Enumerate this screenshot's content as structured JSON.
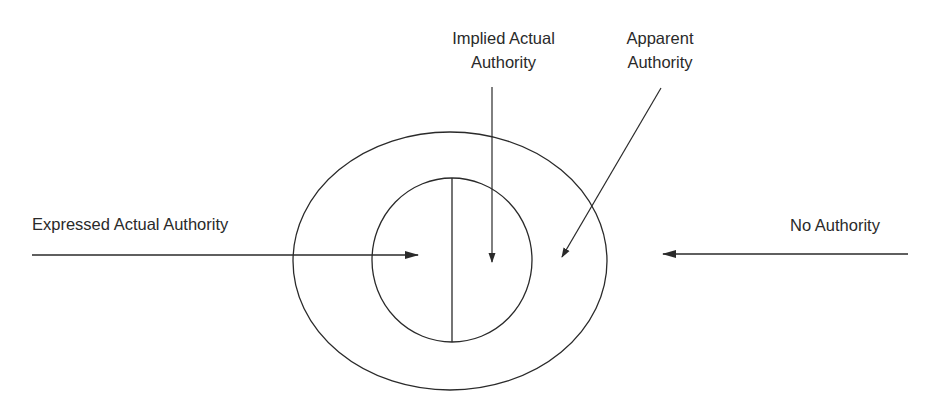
{
  "diagram": {
    "type": "nested-region diagram",
    "labels": {
      "implied_actual_line1": "Implied Actual",
      "implied_actual_line2": "Authority",
      "apparent_line1": "Apparent",
      "apparent_line2": "Authority",
      "expressed_actual": "Expressed Actual Authority",
      "no_authority": "No Authority"
    },
    "regions": [
      {
        "name": "Expressed Actual Authority",
        "location": "inner circle, left half"
      },
      {
        "name": "Implied Actual Authority",
        "location": "inner circle, right half"
      },
      {
        "name": "Apparent Authority",
        "location": "outer ring"
      },
      {
        "name": "No Authority",
        "location": "outside outer ellipse"
      }
    ],
    "colors": {
      "stroke": "#2a2a2a",
      "text": "#2a2a2a",
      "background": "#ffffff"
    }
  }
}
